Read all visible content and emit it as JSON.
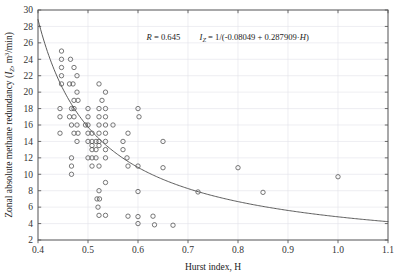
{
  "chart_data": {
    "type": "scatter",
    "title": "",
    "xlabel": "Hurst index, H",
    "ylabel": "Zonal absolute methane redundancy (I_Z, m3/min)",
    "ylabel_parts": {
      "main": "Zonal absolute methane redundancy (",
      "symbol": "I",
      "symbol_sub": "Z",
      "units_pre": ", m",
      "units_sup": "3",
      "units_post": "/min)"
    },
    "xlim": [
      0.4,
      1.1
    ],
    "ylim": [
      2,
      30
    ],
    "xticks": [
      "0.4",
      "0.5",
      "0.6",
      "0.7",
      "0.8",
      "0.9",
      "1.0",
      "1.1"
    ],
    "xtick_values": [
      0.4,
      0.5,
      0.6,
      0.7,
      0.8,
      0.9,
      1.0,
      1.1
    ],
    "yticks": [
      "2",
      "4",
      "6",
      "8",
      "10",
      "12",
      "14",
      "16",
      "18",
      "20",
      "22",
      "24",
      "26",
      "28",
      "30"
    ],
    "ytick_values": [
      2,
      4,
      6,
      8,
      10,
      12,
      14,
      16,
      18,
      20,
      22,
      24,
      26,
      28,
      30
    ],
    "grid": true,
    "legend": "none",
    "marker": {
      "shape": "circle-open",
      "radius": 2.2,
      "stroke": "#555555",
      "fill": "none"
    },
    "annotations": [
      {
        "name": "correlation",
        "text": "R = 0.645",
        "x": 0.617,
        "y": 26.4
      },
      {
        "name": "fit-equation",
        "text": "I_Z = 1/(-0.08049 + 0.287909·H)",
        "x": 0.723,
        "y": 26.4
      }
    ],
    "fit_curve": {
      "name": "regression-curve",
      "formula": "I_Z = 1/(-0.08049 + 0.287909*H)",
      "a": -0.08049,
      "b": 0.287909,
      "color": "#4a4a4a",
      "width": 0.9,
      "x_start": 0.4,
      "x_end": 1.1
    },
    "points": [
      [
        0.447,
        25.0
      ],
      [
        0.447,
        24.0
      ],
      [
        0.465,
        24.0
      ],
      [
        0.447,
        23.0
      ],
      [
        0.472,
        23.0
      ],
      [
        0.447,
        22.0
      ],
      [
        0.478,
        22.0
      ],
      [
        0.447,
        21.0
      ],
      [
        0.463,
        21.0
      ],
      [
        0.47,
        21.0
      ],
      [
        0.522,
        21.0
      ],
      [
        0.478,
        20.0
      ],
      [
        0.535,
        20.0
      ],
      [
        0.472,
        19.0
      ],
      [
        0.48,
        19.0
      ],
      [
        0.528,
        19.0
      ],
      [
        0.444,
        18.0
      ],
      [
        0.467,
        18.0
      ],
      [
        0.472,
        18.0
      ],
      [
        0.5,
        18.0
      ],
      [
        0.522,
        18.0
      ],
      [
        0.535,
        18.0
      ],
      [
        0.6,
        18.0
      ],
      [
        0.444,
        17.0
      ],
      [
        0.463,
        17.0
      ],
      [
        0.472,
        17.0
      ],
      [
        0.5,
        17.0
      ],
      [
        0.522,
        17.0
      ],
      [
        0.535,
        17.0
      ],
      [
        0.602,
        17.0
      ],
      [
        0.467,
        16.0
      ],
      [
        0.478,
        16.0
      ],
      [
        0.495,
        16.0
      ],
      [
        0.5,
        16.0
      ],
      [
        0.522,
        16.0
      ],
      [
        0.535,
        16.0
      ],
      [
        0.55,
        16.0
      ],
      [
        0.444,
        15.0
      ],
      [
        0.472,
        15.0
      ],
      [
        0.48,
        15.0
      ],
      [
        0.5,
        15.0
      ],
      [
        0.508,
        15.0
      ],
      [
        0.522,
        15.0
      ],
      [
        0.535,
        15.0
      ],
      [
        0.58,
        15.0
      ],
      [
        0.478,
        14.0
      ],
      [
        0.5,
        14.0
      ],
      [
        0.508,
        14.0
      ],
      [
        0.516,
        14.0
      ],
      [
        0.522,
        14.0
      ],
      [
        0.535,
        14.0
      ],
      [
        0.57,
        14.0
      ],
      [
        0.65,
        14.0
      ],
      [
        0.508,
        13.5
      ],
      [
        0.522,
        13.5
      ],
      [
        0.508,
        13.0
      ],
      [
        0.516,
        13.0
      ],
      [
        0.535,
        13.0
      ],
      [
        0.57,
        13.0
      ],
      [
        0.467,
        12.0
      ],
      [
        0.5,
        12.0
      ],
      [
        0.508,
        12.0
      ],
      [
        0.516,
        12.0
      ],
      [
        0.535,
        12.0
      ],
      [
        0.578,
        12.0
      ],
      [
        0.467,
        11.0
      ],
      [
        0.508,
        11.0
      ],
      [
        0.522,
        11.0
      ],
      [
        0.58,
        11.0
      ],
      [
        0.6,
        11.0
      ],
      [
        0.65,
        10.8
      ],
      [
        0.8,
        10.8
      ],
      [
        0.467,
        10.0
      ],
      [
        0.1,
        9.7
      ],
      [
        0.535,
        9.0
      ],
      [
        0.522,
        8.0
      ],
      [
        0.6,
        7.9
      ],
      [
        0.72,
        7.85
      ],
      [
        0.85,
        7.8
      ],
      [
        0.518,
        7.0
      ],
      [
        0.523,
        7.0
      ],
      [
        0.52,
        6.0
      ],
      [
        0.522,
        5.0
      ],
      [
        0.535,
        5.0
      ],
      [
        0.58,
        4.9
      ],
      [
        0.6,
        4.85
      ],
      [
        0.63,
        4.9
      ],
      [
        0.6,
        4.0
      ],
      [
        0.633,
        3.85
      ],
      [
        0.67,
        3.8
      ]
    ],
    "points_note": "open circles, n ~ 88"
  },
  "figure": {
    "background": "#ffffff",
    "frame_color": "#5a5a5a",
    "grid_color": "#e3e3ea",
    "text_color": "#222222"
  }
}
